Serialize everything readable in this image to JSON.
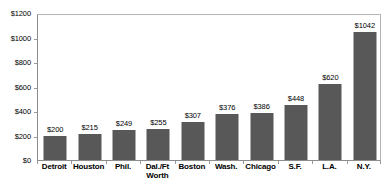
{
  "chart_data": {
    "type": "bar",
    "title": "",
    "subtitle": "",
    "xlabel": "",
    "ylabel": "",
    "categories": [
      "Detroit",
      "Houston",
      "Phil.",
      "Dal./Ft Worth",
      "Boston",
      "Wash.",
      "Chicago",
      "S.F.",
      "L.A.",
      "N.Y."
    ],
    "category_lines": [
      [
        "Detroit"
      ],
      [
        "Houston"
      ],
      [
        "Phil."
      ],
      [
        "Dal./Ft",
        "Worth"
      ],
      [
        "Boston"
      ],
      [
        "Wash."
      ],
      [
        "Chicago"
      ],
      [
        "S.F."
      ],
      [
        "L.A."
      ],
      [
        "N.Y."
      ]
    ],
    "values": [
      200,
      215,
      249,
      255,
      307,
      376,
      386,
      448,
      620,
      1042
    ],
    "value_labels": [
      "$200",
      "$215",
      "$249",
      "$255",
      "$307",
      "$376",
      "$386",
      "$448",
      "$620",
      "$1042"
    ],
    "ylim": [
      0,
      1200
    ],
    "ytick_values": [
      0,
      200,
      400,
      600,
      800,
      1000,
      1200
    ],
    "ytick_labels": [
      "$0",
      "$200",
      "$400",
      "$600",
      "$800",
      "$1000",
      "$1200"
    ],
    "grid": false,
    "legend": false,
    "legend_position": "none",
    "bar_color": "#585858",
    "axis_color": "#8c8c8c",
    "background_color": "#ffffff",
    "text_color": "#000000"
  }
}
